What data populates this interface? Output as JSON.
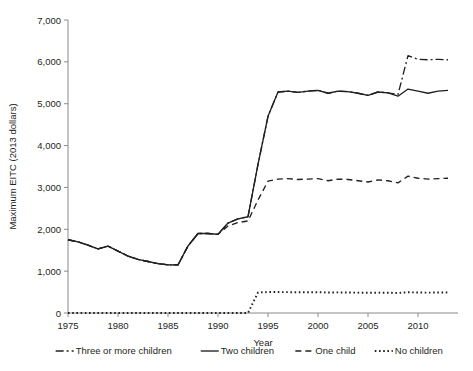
{
  "chart_data": {
    "type": "line",
    "title": "",
    "xlabel": "Year",
    "ylabel": "Maximum EITC (2013 dollars)",
    "xlim": [
      1975,
      2014
    ],
    "ylim": [
      0,
      7000
    ],
    "xticks": [
      1975,
      1980,
      1985,
      1990,
      1995,
      2000,
      2005,
      2010
    ],
    "xticklabels": [
      "1975",
      "1980",
      "1985",
      "1990",
      "1995",
      "2000",
      "2005",
      "2010"
    ],
    "yticks": [
      0,
      1000,
      2000,
      3000,
      4000,
      5000,
      6000,
      7000
    ],
    "yticklabels": [
      "0",
      "1,000",
      "2,000",
      "3,000",
      "4,000",
      "5,000",
      "6,000",
      "7,000"
    ],
    "grid": false,
    "legend_position": "bottom",
    "x": [
      1975,
      1976,
      1977,
      1978,
      1979,
      1980,
      1981,
      1982,
      1983,
      1984,
      1985,
      1986,
      1987,
      1988,
      1989,
      1990,
      1991,
      1992,
      1993,
      1994,
      1995,
      1996,
      1997,
      1998,
      1999,
      2000,
      2001,
      2002,
      2003,
      2004,
      2005,
      2006,
      2007,
      2008,
      2009,
      2010,
      2011,
      2012,
      2013
    ],
    "series": [
      {
        "name": "Three or more children",
        "style": "dashdot",
        "values": [
          1750,
          1700,
          1620,
          1530,
          1600,
          1480,
          1360,
          1280,
          1230,
          1180,
          1150,
          1150,
          1600,
          1900,
          1900,
          1880,
          2150,
          2250,
          2300,
          3550,
          4700,
          5280,
          5300,
          5270,
          5300,
          5320,
          5250,
          5300,
          5290,
          5250,
          5200,
          5280,
          5260,
          5220,
          6150,
          6060,
          6050,
          6060,
          6050
        ]
      },
      {
        "name": "Two children",
        "style": "solid",
        "values": [
          1750,
          1700,
          1620,
          1530,
          1600,
          1480,
          1360,
          1280,
          1230,
          1180,
          1150,
          1150,
          1600,
          1900,
          1900,
          1880,
          2150,
          2250,
          2300,
          3550,
          4700,
          5280,
          5300,
          5270,
          5300,
          5320,
          5250,
          5300,
          5290,
          5250,
          5200,
          5280,
          5260,
          5180,
          5350,
          5300,
          5250,
          5300,
          5320
        ]
      },
      {
        "name": "One child",
        "style": "dashed",
        "values": [
          1750,
          1700,
          1620,
          1530,
          1600,
          1480,
          1360,
          1280,
          1230,
          1180,
          1150,
          1150,
          1600,
          1900,
          1900,
          1880,
          2080,
          2160,
          2200,
          2700,
          3150,
          3200,
          3210,
          3190,
          3200,
          3210,
          3160,
          3200,
          3190,
          3160,
          3130,
          3180,
          3160,
          3110,
          3270,
          3220,
          3200,
          3210,
          3220
        ]
      },
      {
        "name": "No children",
        "style": "dotted",
        "values": [
          0,
          0,
          0,
          0,
          0,
          0,
          0,
          0,
          0,
          0,
          0,
          0,
          0,
          0,
          0,
          0,
          0,
          0,
          0,
          490,
          500,
          500,
          498,
          495,
          495,
          496,
          490,
          492,
          490,
          486,
          482,
          486,
          484,
          478,
          496,
          490,
          487,
          490,
          492
        ]
      }
    ]
  },
  "legend": {
    "entries": [
      {
        "label": "Three or more children",
        "style": "dashdot"
      },
      {
        "label": "Two children",
        "style": "solid"
      },
      {
        "label": "One child",
        "style": "dashed"
      },
      {
        "label": "No children",
        "style": "dotted"
      }
    ]
  },
  "colors": {
    "line": "#231f20",
    "axis": "#8a8a8a",
    "background": "#ffffff"
  }
}
